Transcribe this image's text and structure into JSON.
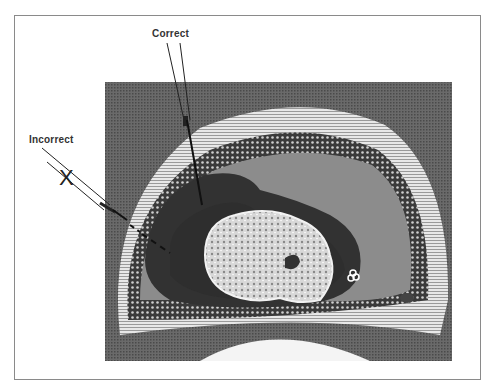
{
  "figure": {
    "labels": {
      "correct": "Correct",
      "incorrect": "Incorrect",
      "incorrect_mark": "X"
    },
    "colors": {
      "background": "#ffffff",
      "frame_border": "#8a8a8a",
      "ct_background": "#5a5a5a",
      "fluid_dark": "#3a3a3a",
      "fluid_gray": "#8c8c8c",
      "bone_white": "#eeeeee",
      "needle": "#222222"
    }
  }
}
